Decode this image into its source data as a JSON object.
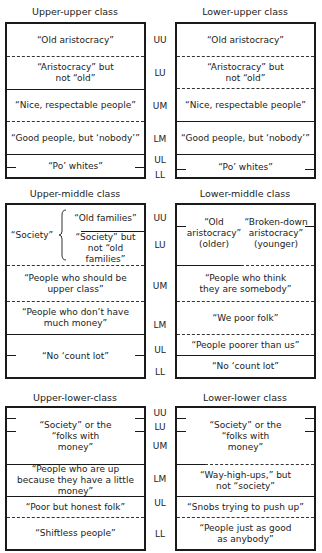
{
  "level_labels": [
    "UU",
    "LU",
    "UM",
    "LM",
    "UL",
    "LL"
  ],
  "panels": [
    {
      "left": {
        "title": "Upper-upper class",
        "cells": [
          "“Old aristocracy”",
          "“Aristocracy” but not “old”",
          "“Nice, respectable people”",
          "“Good people, but ‘nobody’”",
          "“Po’ whites”"
        ]
      },
      "right": {
        "title": "Lower-upper class",
        "cells": [
          "“Old aristocracy”",
          "“Aristocracy” but not “old”",
          "“Nice, respectable people”",
          "“Good people, but ‘nobody’”",
          "“Po’ whites”"
        ]
      }
    },
    {
      "left": {
        "title": "Upper-middle class",
        "society_label": "“Society”",
        "cells": [
          "“Old families”",
          "“Society” but not “old families”",
          "“People who should be upper class”",
          "“People who don’t have much money”",
          "“No ‘count lot”"
        ]
      },
      "right": {
        "title": "Lower-middle class",
        "cells": [
          "“Old aristocracy” (older)",
          "“Broken-down aristocracy” (younger)",
          "“People who think they are somebody”",
          "“We poor folk”",
          "“People poorer than us”",
          "“No ‘count lot”"
        ]
      }
    },
    {
      "left": {
        "title": "Upper-lower-class",
        "cells": [
          "“Society” or the “folks with money”",
          "“People who are up because they have a little money”",
          "“Poor but honest folk”",
          "“Shiftless people”"
        ]
      },
      "right": {
        "title": "Lower-lower class",
        "cells": [
          "“Society” or the “folks with money”",
          "“Way-high-ups,” but not “society”",
          "“Snobs trying to push up”",
          "“People just as good as anybody”"
        ]
      }
    }
  ]
}
